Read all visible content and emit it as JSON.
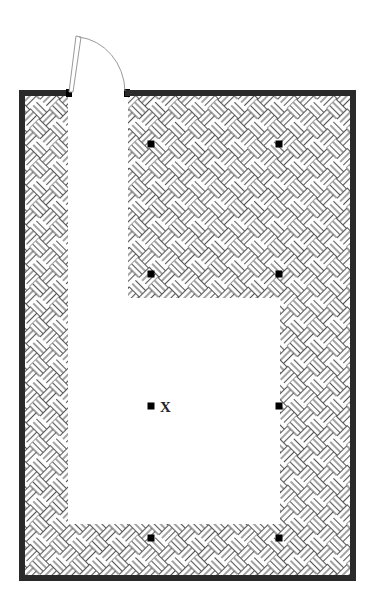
{
  "diagram": {
    "type": "floor-plan",
    "canvas": {
      "width": 373,
      "height": 616
    },
    "colors": {
      "wall": "#2a2a2a",
      "hatch_line": "#555555",
      "background": "#ffffff",
      "marker": "#000000",
      "door_line": "#999999"
    },
    "room": {
      "outer": {
        "x": 19,
        "y": 90,
        "width": 337,
        "height": 491
      },
      "wall_thickness": 6,
      "door_gap": {
        "x_start": 71,
        "x_end": 125
      }
    },
    "walkable_area": {
      "description": "L-shaped clear corridor (unhatched)",
      "polygon": [
        [
          68,
          96
        ],
        [
          128,
          96
        ],
        [
          128,
          298
        ],
        [
          280,
          298
        ],
        [
          280,
          524
        ],
        [
          68,
          524
        ]
      ]
    },
    "door": {
      "hinge": [
        72,
        93
      ],
      "leaf_top": [
        78,
        36
      ],
      "arc_end": [
        125,
        92
      ],
      "swing": "outward"
    },
    "markers": [
      {
        "id": "m1",
        "x": 151,
        "y": 144,
        "label": ""
      },
      {
        "id": "m2",
        "x": 279,
        "y": 144,
        "label": ""
      },
      {
        "id": "m3",
        "x": 151,
        "y": 274,
        "label": ""
      },
      {
        "id": "m4",
        "x": 279,
        "y": 274,
        "label": ""
      },
      {
        "id": "m5",
        "x": 151,
        "y": 406,
        "label": "X"
      },
      {
        "id": "m6",
        "x": 279,
        "y": 406,
        "label": ""
      },
      {
        "id": "m7",
        "x": 151,
        "y": 538,
        "label": ""
      },
      {
        "id": "m8",
        "x": 279,
        "y": 538,
        "label": ""
      }
    ],
    "marker_size": 7,
    "hatch_pattern": "basket-weave diagonal"
  }
}
